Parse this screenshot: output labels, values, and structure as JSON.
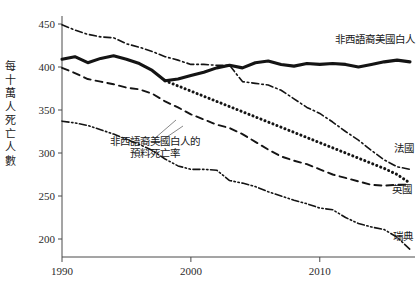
{
  "chart_data": {
    "type": "line",
    "title": "",
    "xlabel": "",
    "ylabel": "每十萬人死亡人數",
    "xlim": [
      1990,
      2017
    ],
    "ylim": [
      180,
      455
    ],
    "xticks": [
      1990,
      2000,
      2010
    ],
    "yticks": [
      200,
      250,
      300,
      350,
      400,
      450
    ],
    "grid": false,
    "legend_position": "inline-right",
    "series": [
      {
        "name": "非西語裔美國白人",
        "style": "solid",
        "x": [
          1990,
          1991,
          1992,
          1993,
          1994,
          1995,
          1996,
          1997,
          1998,
          1999,
          2000,
          2001,
          2002,
          2003,
          2004,
          2005,
          2006,
          2007,
          2008,
          2009,
          2010,
          2011,
          2012,
          2013,
          2014,
          2015,
          2016,
          2017
        ],
        "values": [
          409,
          412,
          405,
          410,
          413,
          409,
          404,
          396,
          384,
          386,
          390,
          394,
          399,
          402,
          399,
          405,
          407,
          403,
          401,
          404,
          403,
          404,
          403,
          400,
          403,
          406,
          408,
          406
        ]
      },
      {
        "name": "法國",
        "style": "dash-dot",
        "x": [
          1990,
          1991,
          1992,
          1993,
          1994,
          1995,
          1996,
          1997,
          1998,
          1999,
          2000,
          2001,
          2002,
          2003,
          2004,
          2005,
          2006,
          2007,
          2008,
          2009,
          2010,
          2011,
          2012,
          2013,
          2014,
          2015,
          2016,
          2017
        ],
        "values": [
          449,
          443,
          438,
          435,
          434,
          427,
          423,
          418,
          412,
          408,
          403,
          403,
          402,
          402,
          383,
          381,
          379,
          373,
          363,
          353,
          346,
          336,
          325,
          315,
          303,
          292,
          284,
          281
        ]
      },
      {
        "name": "英國",
        "style": "dashed",
        "x": [
          1990,
          1991,
          1992,
          1993,
          1994,
          1995,
          1996,
          1997,
          1998,
          1999,
          2000,
          2001,
          2002,
          2003,
          2004,
          2005,
          2006,
          2007,
          2008,
          2009,
          2010,
          2011,
          2012,
          2013,
          2014,
          2015,
          2016,
          2017
        ],
        "values": [
          399,
          393,
          386,
          383,
          380,
          376,
          374,
          369,
          360,
          353,
          345,
          339,
          333,
          329,
          322,
          313,
          304,
          296,
          291,
          287,
          281,
          275,
          271,
          267,
          263,
          262,
          263,
          263
        ]
      },
      {
        "name": "瑞典",
        "style": "dash-dot-dot",
        "x": [
          1990,
          1991,
          1992,
          1993,
          1994,
          1995,
          1996,
          1997,
          1998,
          1999,
          2000,
          2001,
          2002,
          2003,
          2004,
          2005,
          2006,
          2007,
          2008,
          2009,
          2010,
          2011,
          2012,
          2013,
          2014,
          2015,
          2016,
          2017
        ],
        "values": [
          337,
          335,
          332,
          327,
          322,
          316,
          310,
          303,
          293,
          285,
          281,
          281,
          280,
          268,
          265,
          261,
          255,
          250,
          245,
          241,
          236,
          234,
          225,
          218,
          214,
          211,
          202,
          188
        ]
      },
      {
        "name": "非西語裔美國白人的預料死亡率",
        "style": "dotted",
        "x": [
          1998,
          1999,
          2000,
          2001,
          2002,
          2003,
          2004,
          2005,
          2006,
          2007,
          2008,
          2009,
          2010,
          2011,
          2012,
          2013,
          2014,
          2015,
          2016,
          2017
        ],
        "values": [
          384,
          378,
          372,
          366,
          360,
          354,
          348,
          342,
          336,
          330,
          324,
          318,
          312,
          306,
          300,
          294,
          288,
          282,
          275,
          265
        ]
      }
    ]
  },
  "labels": {
    "us": "非西語裔美國白人",
    "france": "法國",
    "uk": "英國",
    "sweden": "瑞典",
    "projected_line1": "非西語裔美國白人的",
    "projected_line2": "預料死亡率"
  },
  "y_axis": {
    "title_chars": [
      "每",
      "十",
      "萬",
      "人",
      "死",
      "亡",
      "人",
      "數"
    ],
    "ticks": [
      "450",
      "400",
      "350",
      "300",
      "250",
      "200"
    ]
  },
  "x_axis": {
    "ticks": [
      "1990",
      "2000",
      "2010"
    ]
  }
}
